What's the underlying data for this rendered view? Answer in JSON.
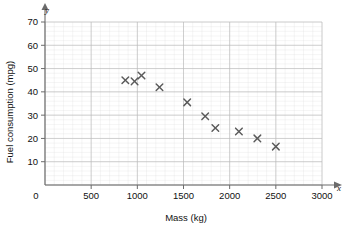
{
  "chart_data": {
    "type": "scatter",
    "title": "",
    "xlabel": "Mass (kg)",
    "ylabel": "Fuel consumption (mpg)",
    "x_axis_letter": "x",
    "y_axis_letter": "y",
    "xlim": [
      0,
      3000
    ],
    "ylim": [
      0,
      70
    ],
    "x_ticks": [
      0,
      500,
      1000,
      1500,
      2000,
      2500,
      3000
    ],
    "x_tick_labels": [
      "0",
      "500",
      "1000",
      "1500",
      "2000",
      "2500",
      "3000"
    ],
    "y_ticks": [
      0,
      10,
      20,
      30,
      40,
      50,
      60,
      70
    ],
    "y_tick_labels": [
      "0",
      "10",
      "20",
      "30",
      "40",
      "50",
      "60",
      "70"
    ],
    "grid": true,
    "grid_major_step_x": 500,
    "grid_major_step_y": 10,
    "grid_minor_step_x": 100,
    "grid_minor_step_y": 2,
    "legend": null,
    "marker_style": "x",
    "marker_color": "#5a5a5a",
    "points": [
      {
        "x": 870,
        "y": 45.0
      },
      {
        "x": 970,
        "y": 44.5
      },
      {
        "x": 1045,
        "y": 47.0
      },
      {
        "x": 1240,
        "y": 42.0
      },
      {
        "x": 1540,
        "y": 35.5
      },
      {
        "x": 1735,
        "y": 29.5
      },
      {
        "x": 1845,
        "y": 24.5
      },
      {
        "x": 2100,
        "y": 23.0
      },
      {
        "x": 2300,
        "y": 20.0
      },
      {
        "x": 2500,
        "y": 16.5
      }
    ]
  },
  "origin_label": "0"
}
